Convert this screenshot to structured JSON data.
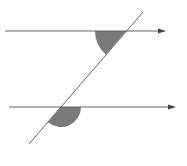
{
  "diagram": {
    "colors": {
      "line": "#555555",
      "shade": "#7a7a7a",
      "background": "#ffffff"
    },
    "top_line": {
      "x1": 5,
      "y1": 31,
      "x2": 165,
      "y2": 31
    },
    "bottom_line": {
      "x1": 9,
      "y1": 107,
      "x2": 175,
      "y2": 107
    },
    "transversal": {
      "x1": 29,
      "y1": 144,
      "x2": 143,
      "y2": 12
    },
    "angles": [
      {
        "name": "top-angle",
        "cx": 126,
        "cy": 31,
        "r": 31,
        "position": "below-left"
      },
      {
        "name": "bottom-angle",
        "cx": 61,
        "cy": 107,
        "r": 20,
        "position": "below-right"
      }
    ]
  }
}
